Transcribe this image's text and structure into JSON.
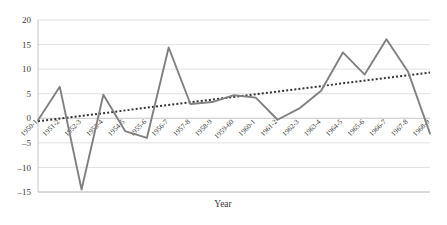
{
  "chart_data": {
    "type": "line",
    "title": "",
    "xlabel": "Year",
    "ylabel": "",
    "ylim": [
      -15,
      20
    ],
    "ytick_step": 5,
    "yticks": [
      20,
      15,
      10,
      5,
      0,
      -5,
      -10,
      -15
    ],
    "ytick_labels": [
      "20",
      "15",
      "10",
      "5",
      "0",
      "–5",
      "–10",
      "–15"
    ],
    "grid": true,
    "legend": "none",
    "categories": [
      "1950-1",
      "1951-2",
      "1952-3",
      "1953-4",
      "1954-5",
      "1955-6",
      "1956-7",
      "1957-8",
      "1958-9",
      "1959-60",
      "1960-1",
      "1961-2",
      "1962-3",
      "1963-4",
      "1964-5",
      "1965-6",
      "1966-7",
      "1967-8",
      "1968-9"
    ],
    "series": [
      {
        "name": "Annual change",
        "kind": "line",
        "color": "#808080",
        "values": [
          -0.4,
          6.4,
          -14.5,
          4.8,
          -2.6,
          -4.0,
          14.4,
          2.9,
          3.3,
          4.7,
          4.2,
          -0.3,
          2.0,
          5.6,
          13.4,
          8.9,
          16.1,
          9.4,
          -3.1
        ]
      },
      {
        "name": "Linear trend",
        "kind": "trend",
        "style": "dotted",
        "color": "#333333",
        "endpoints": [
          -0.6,
          9.3
        ]
      }
    ],
    "colors": {
      "series": "#808080",
      "trend": "#333333",
      "grid": "#d9d9d9",
      "axis": "#bfbfbf",
      "text": "#3a3a3a",
      "background": "#ffffff"
    }
  },
  "axis": {
    "x_title": "Year"
  }
}
